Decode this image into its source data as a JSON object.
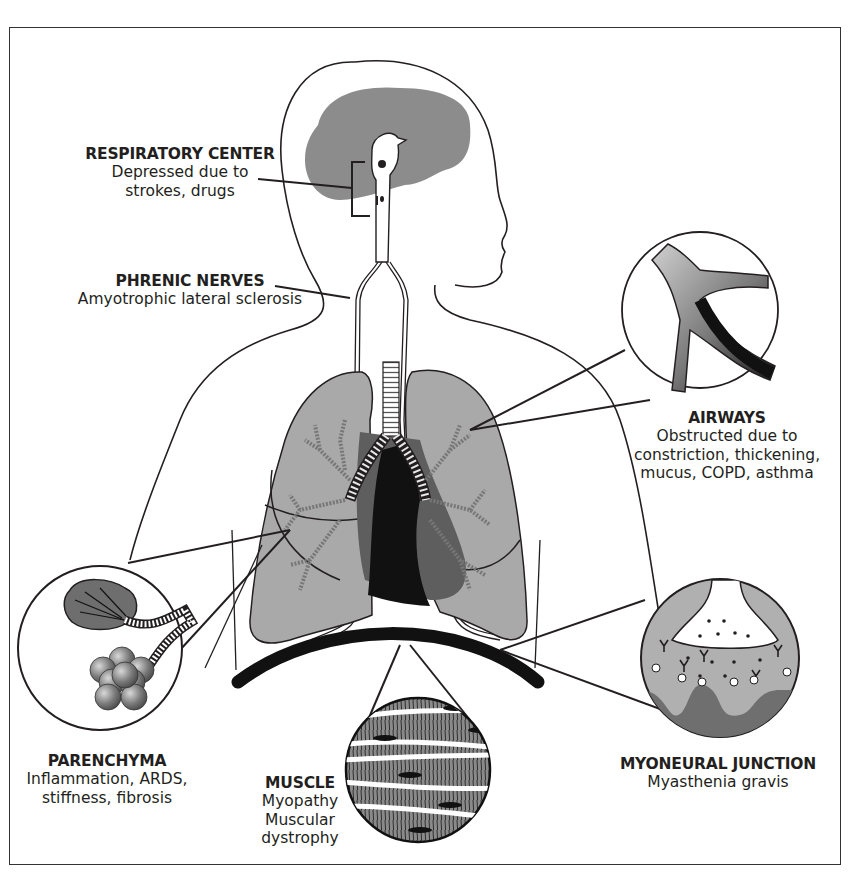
{
  "diagram": {
    "type": "anatomical illustration",
    "colors": {
      "line": "#231f20",
      "lung_fill": "#a9a9a9",
      "brain_fill": "#8c8c8c",
      "heart_dark": "#111111",
      "heart_mid": "#5e5e5e",
      "background": "#ffffff"
    }
  },
  "labels": {
    "respiratory_center": {
      "title": "RESPIRATORY CENTER",
      "desc": "Depressed due to\nstrokes, drugs"
    },
    "phrenic_nerves": {
      "title": "PHRENIC NERVES",
      "desc": "Amyotrophic lateral sclerosis"
    },
    "airways": {
      "title": "AIRWAYS",
      "desc": "Obstructed due to\nconstriction, thickening,\nmucus, COPD, asthma"
    },
    "parenchyma": {
      "title": "PARENCHYMA",
      "desc": "Inflammation, ARDS,\nstiffness, fibrosis"
    },
    "muscle": {
      "title": "MUSCLE",
      "desc": "Myopathy\nMuscular dystrophy"
    },
    "myoneural_junction": {
      "title": "MYONEURAL JUNCTION",
      "desc": "Myasthenia gravis"
    }
  },
  "insets": [
    {
      "name": "airways-inset",
      "shows": "bronchial tree with narrowed, darkened airway"
    },
    {
      "name": "parenchyma-inset",
      "shows": "alveolar clusters: collapsed/fibrotic and normal"
    },
    {
      "name": "muscle-inset",
      "shows": "striated muscle fibers"
    },
    {
      "name": "myoneural-junction-inset",
      "shows": "nerve terminal, vesicles, receptors, antibodies"
    }
  ]
}
